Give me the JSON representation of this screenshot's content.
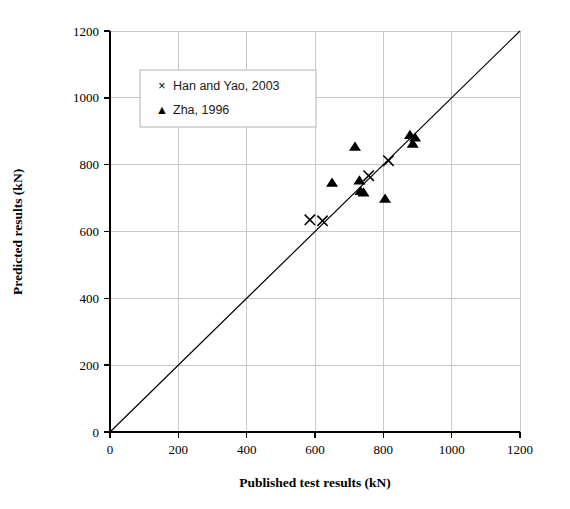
{
  "chart_data": {
    "type": "scatter",
    "title": "",
    "xlabel": "Published test results (kN)",
    "ylabel": "Predicted results (kN)",
    "xlim": [
      0,
      1200
    ],
    "ylim": [
      0,
      1200
    ],
    "xticks": [
      0,
      200,
      400,
      600,
      800,
      1000,
      1200
    ],
    "yticks": [
      0,
      200,
      400,
      600,
      800,
      1000,
      1200
    ],
    "grid": true,
    "legend_position": "upper-left",
    "reference_line": {
      "name": "line-of-equality",
      "from": [
        0,
        0
      ],
      "to": [
        1200,
        1200
      ]
    },
    "series": [
      {
        "name": "Han and Yao, 2003",
        "marker": "cross",
        "color": "#000000",
        "points": [
          [
            585,
            635
          ],
          [
            622,
            632
          ],
          [
            757,
            767
          ],
          [
            815,
            812
          ]
        ]
      },
      {
        "name": "Zha, 1996",
        "marker": "triangle",
        "color": "#000000",
        "points": [
          [
            650,
            745
          ],
          [
            717,
            853
          ],
          [
            730,
            752
          ],
          [
            733,
            720
          ],
          [
            742,
            716
          ],
          [
            805,
            697
          ],
          [
            878,
            888
          ],
          [
            893,
            880
          ],
          [
            886,
            862
          ]
        ]
      }
    ]
  },
  "legend": {
    "entries": [
      {
        "glyph": "×",
        "label": "Han and Yao, 2003"
      },
      {
        "glyph": "▲",
        "label": "Zha, 1996"
      }
    ]
  },
  "axes": {
    "x_title": "Published test results (kN)",
    "y_title": "Predicted results (kN)",
    "x_tick_labels": [
      "0",
      "200",
      "400",
      "600",
      "800",
      "1000",
      "1200"
    ],
    "y_tick_labels": [
      "0",
      "200",
      "400",
      "600",
      "800",
      "1000",
      "1200"
    ]
  },
  "colors": {
    "grid": "#c8c8c8",
    "axis": "#000000",
    "marker": "#000000",
    "legend_border": "#b4b4b4",
    "background": "#ffffff"
  }
}
